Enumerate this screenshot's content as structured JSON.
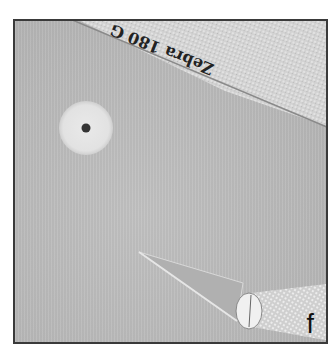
{
  "image": {
    "description": "Photo panel showing a small white washer with center hole on a gray surface, an emery board diagonally across the top-right, and a hobby knife at the bottom right",
    "panel_label": "f",
    "emery_board_text": "Zebra 180 G",
    "colors": {
      "background": "#bcbcbc",
      "frame_border": "#3a3a3a",
      "washer": "#e6e6e6",
      "washer_hole": "#333333",
      "emery_board": "#d4d4d4",
      "label": "#111111"
    }
  }
}
